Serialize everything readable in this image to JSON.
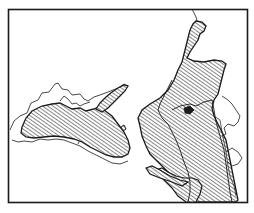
{
  "figure": {
    "type": "hatched-outline-map",
    "frame": {
      "x": 8,
      "y": 9,
      "width": 240,
      "height": 194
    },
    "colors": {
      "ink": "#1a1a1a",
      "paper": "#ffffff",
      "hatch": "#222222"
    },
    "regions": [
      {
        "id": "west-region",
        "style": "hatched"
      },
      {
        "id": "west-peninsula",
        "style": "hatched"
      },
      {
        "id": "east-region",
        "style": "hatched"
      },
      {
        "id": "east-southwest-lobe",
        "style": "hatched"
      },
      {
        "id": "outline-areas",
        "style": "outline-only"
      }
    ]
  }
}
